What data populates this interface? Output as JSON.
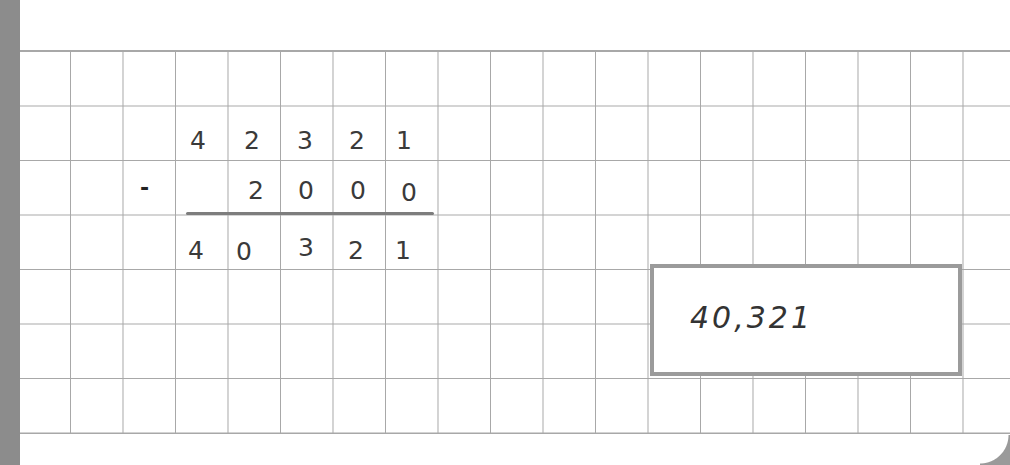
{
  "worksheet": {
    "operation": "subtraction",
    "operator_symbol": "-",
    "minuend_digits": [
      "4",
      "2",
      "3",
      "2",
      "1"
    ],
    "subtrahend_digits": [
      "",
      "2",
      "0",
      "0",
      "0"
    ],
    "difference_digits": [
      "4",
      "0",
      "3",
      "2",
      "1"
    ],
    "answer_box": {
      "value": "40,321"
    }
  },
  "colors": {
    "grid_line": "#a8a8a8",
    "answer_box_border": "#9b9b9b",
    "ink": "#3a3a3a",
    "left_strip": "#8c8c8c"
  }
}
